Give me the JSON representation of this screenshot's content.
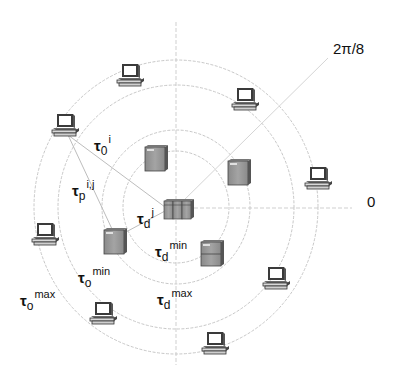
{
  "diagram": {
    "center": {
      "x": 176,
      "y": 207
    },
    "rings": [
      {
        "name": "tau_d_min",
        "rx": 53,
        "ry": 56
      },
      {
        "name": "tau_d_max",
        "rx": 74,
        "ry": 77
      },
      {
        "name": "tau_o_min",
        "rx": 118,
        "ry": 122
      },
      {
        "name": "tau_o_max",
        "rx": 142,
        "ry": 147
      }
    ],
    "ring_color": "#c8c8c8",
    "axis_color": "#cfcfcf",
    "axes": {
      "zero_label": "0",
      "diagonal_label": "2π/8"
    },
    "labels": {
      "tau_o_i": {
        "base": "τ",
        "sub": "0",
        "sup": "i"
      },
      "tau_p_ij": {
        "base": "τ",
        "sub": "p",
        "sup": "i,j"
      },
      "tau_d_j": {
        "base": "τ",
        "sub": "d",
        "sup": "j"
      },
      "tau_d_min": {
        "base": "τ",
        "sub": "d",
        "sup": "min"
      },
      "tau_o_min": {
        "base": "τ",
        "sub": "o",
        "sup": "min"
      },
      "tau_o_max": {
        "base": "τ",
        "sub": "o",
        "sup": "max"
      },
      "tau_d_max": {
        "base": "τ",
        "sub": "d",
        "sup": "max"
      }
    },
    "nodes": {
      "cluster": {
        "type": "server-cluster",
        "x": 163,
        "y": 199
      },
      "servers": [
        {
          "x": 145,
          "y": 145
        },
        {
          "x": 228,
          "y": 160
        },
        {
          "x": 104,
          "y": 228
        },
        {
          "x": 200,
          "y": 240
        }
      ],
      "computers": [
        {
          "x": 117,
          "y": 64
        },
        {
          "x": 232,
          "y": 88
        },
        {
          "x": 52,
          "y": 114
        },
        {
          "x": 305,
          "y": 167
        },
        {
          "x": 32,
          "y": 223
        },
        {
          "x": 263,
          "y": 267
        },
        {
          "x": 90,
          "y": 302
        },
        {
          "x": 202,
          "y": 332
        }
      ]
    }
  }
}
